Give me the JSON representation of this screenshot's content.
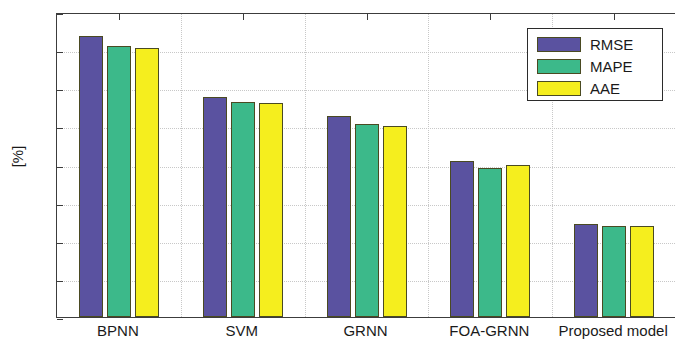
{
  "chart_data": {
    "type": "bar",
    "title": "",
    "subtitle": "",
    "xlabel": "",
    "ylabel": "[%]",
    "categories": [
      "BPNN",
      "SVM",
      "GRNN",
      "FOA-GRNN",
      "Proposed model"
    ],
    "series": [
      {
        "name": "RMSE",
        "color": "#5a52a0",
        "values": [
          3.69,
          2.89,
          2.64,
          2.05,
          1.22
        ]
      },
      {
        "name": "MAPE",
        "color": "#3cb98a",
        "values": [
          3.56,
          2.82,
          2.53,
          1.95,
          1.19
        ]
      },
      {
        "name": "AAE",
        "color": "#f5ee1e",
        "values": [
          3.53,
          2.81,
          2.51,
          2.0,
          1.2
        ]
      }
    ],
    "ylim": [
      0,
      4
    ],
    "yticks": [
      0,
      0.5,
      1,
      1.5,
      2,
      2.5,
      3,
      3.5,
      4
    ],
    "ytick_labels": [
      "0",
      "0.5",
      "1",
      "1.5",
      "2",
      "2.5",
      "3",
      "3.5",
      "4"
    ],
    "grid": true,
    "legend": {
      "position": "top-right",
      "entries": [
        "RMSE",
        "MAPE",
        "AAE"
      ]
    },
    "bar_edge_color": "#4a4a22",
    "axis_color": "#3c3c3c"
  }
}
